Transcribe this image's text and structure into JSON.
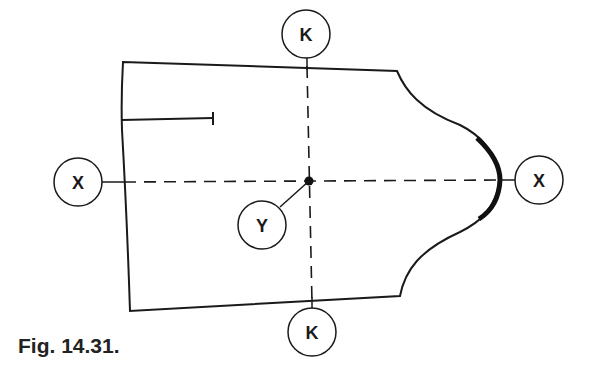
{
  "figure": {
    "caption": "Fig. 14.31."
  },
  "labels": {
    "k_top": "K",
    "k_bottom": "K",
    "x_left": "X",
    "x_right": "X",
    "y_center": "Y"
  },
  "colors": {
    "line": "#1a1a1a",
    "background": "#ffffff"
  }
}
